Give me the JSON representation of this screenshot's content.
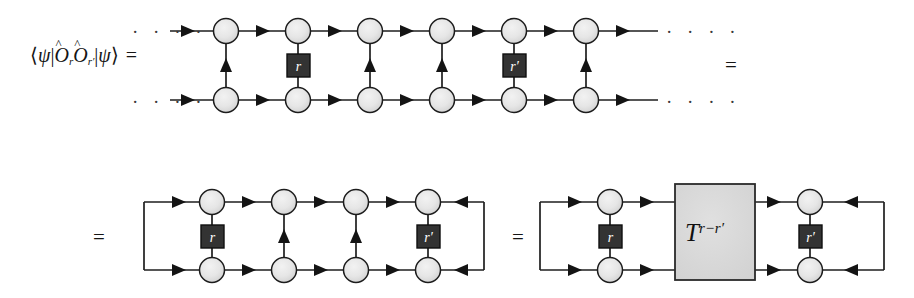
{
  "figure": {
    "kind": "tensor-network-diagram",
    "title_label": "",
    "colors": {
      "background": "#ffffff",
      "wire": "#1e1e1e",
      "node_fill_light": "#ececec",
      "node_fill_dark": "#d4d4d4",
      "node_stroke": "#1c1c1c",
      "operator_box_fill": "#333333",
      "operator_box_stroke": "#101010",
      "operator_box_text": "#ffffff",
      "transfer_box_fill": "#d9d9d9",
      "transfer_box_stroke": "#2a2a2a",
      "math_text": "#151515"
    }
  },
  "line1": {
    "formula": {
      "bra_open": "⟨",
      "psi": "ψ",
      "bar": "|",
      "op1": "O",
      "op1_sub": "r",
      "op2": "O",
      "op2_sub": "r′",
      "ket_close": "⟩",
      "equals": "=",
      "plain_text": "⟨ψ|Ô_r Ô_r′|ψ⟩ ="
    },
    "left_dots": "· · · ·",
    "right_dots": "· · · ·",
    "trailing_equals": "=",
    "columns": 6,
    "operator_boxes": [
      {
        "column": 2,
        "label": "r"
      },
      {
        "column": 5,
        "label": "r′"
      }
    ],
    "vertical_arrow_columns": [
      1,
      3,
      4,
      6
    ],
    "top_wire_direction": "right",
    "bottom_wire_direction": "right"
  },
  "line2": {
    "leading_equals": "=",
    "trailing_equals": "=",
    "columns": 4,
    "operator_boxes": [
      {
        "column": 1,
        "label": "r"
      },
      {
        "column": 4,
        "label": "r′"
      }
    ],
    "vertical_arrow_columns": [
      2,
      3
    ],
    "closed_loop": true,
    "left_return_direction": "right",
    "right_return_direction": "left"
  },
  "line3": {
    "columns": 2,
    "operator_boxes": [
      {
        "column": 1,
        "label": "r"
      },
      {
        "column": 2,
        "label": "r′"
      }
    ],
    "transfer_box": {
      "base": "T",
      "exponent": "r−r′",
      "plain_text": "T^{r-r′}"
    },
    "closed_loop": true
  }
}
